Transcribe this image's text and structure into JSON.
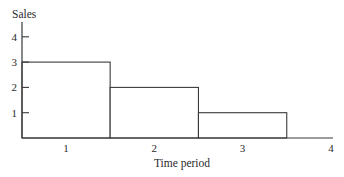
{
  "chart_data": {
    "type": "bar",
    "title": "",
    "xlabel": "Time period",
    "ylabel": "Sales",
    "categories": [
      "1",
      "2",
      "3"
    ],
    "values": [
      3,
      2,
      1
    ],
    "x_tick_labels": [
      "1",
      "2",
      "3",
      "4"
    ],
    "y_tick_labels": [
      "1",
      "2",
      "3",
      "4"
    ],
    "y_ticks": [
      1,
      2,
      3,
      4
    ],
    "ylim": [
      0,
      4.7
    ],
    "xlim": [
      0.5,
      4.2
    ],
    "grid": false,
    "legend": "none",
    "bar_style": "outlined, adjacent (histogram-style)",
    "colors": {
      "stroke": "#3a3a3a",
      "fill": "#ffffff",
      "text": "#2a2a2a"
    }
  }
}
